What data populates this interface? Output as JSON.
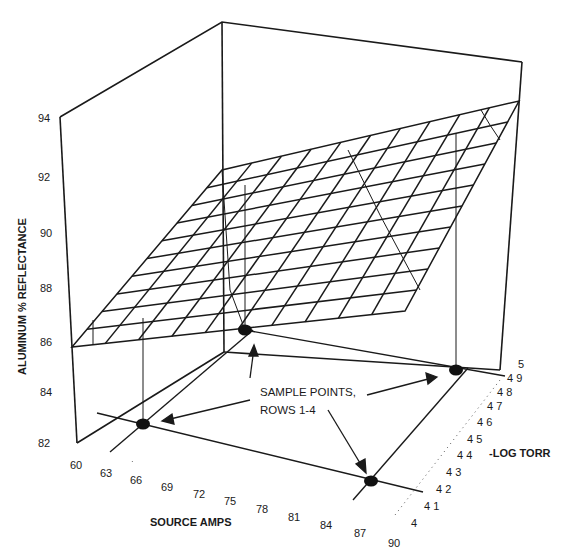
{
  "chart_data": {
    "type": "surface3d",
    "title": "",
    "zlabel": "ALUMINUM % REFLECTANCE",
    "xlabel": "SOURCE AMPS",
    "ylabel": "-LOG TORR",
    "z_ticks": [
      "82",
      "84",
      "86",
      "88",
      "90",
      "92",
      "94"
    ],
    "z_range": [
      82,
      94
    ],
    "x_ticks": [
      "60",
      "63",
      "66",
      "69",
      "72",
      "75",
      "78",
      "81",
      "84",
      "87",
      "90"
    ],
    "x_range": [
      60,
      90
    ],
    "y_ticks": [
      "4",
      "4 1",
      "4 2",
      "4 3",
      "4 4",
      "4 5",
      "4 6",
      "4 7",
      "4 8",
      "4 9",
      "5"
    ],
    "y_values": [
      4.0,
      4.1,
      4.2,
      4.3,
      4.4,
      4.5,
      4.6,
      4.7,
      4.8,
      4.9,
      5.0
    ],
    "y_range": [
      4.0,
      5.0
    ],
    "surface": {
      "description": "Planar response surface rising from ~86% at (60 A, -log torr 4) to ~93% at (90 A, -log torr 5)",
      "corners": [
        {
          "amps": 60,
          "neg_log_torr": 4.0,
          "reflectance": 86.0
        },
        {
          "amps": 60,
          "neg_log_torr": 5.0,
          "reflectance": 90.3
        },
        {
          "amps": 90,
          "neg_log_torr": 5.0,
          "reflectance": 93.4
        },
        {
          "amps": 90,
          "neg_log_torr": 4.0,
          "reflectance": 89.0
        }
      ],
      "grid_divisions": 10
    },
    "sample_points": [
      {
        "amps": 63,
        "neg_log_torr": 4.9
      },
      {
        "amps": 63,
        "neg_log_torr": 4.3
      },
      {
        "amps": 87,
        "neg_log_torr": 4.9
      },
      {
        "amps": 87,
        "neg_log_torr": 4.2
      }
    ],
    "annotations": [
      {
        "text": "SAMPLE POINTS,",
        "line": 1
      },
      {
        "text": "ROWS 1-4",
        "line": 2
      }
    ],
    "grid": false,
    "legend": "none"
  },
  "labels": {
    "zlabel": "ALUMINUM % REFLECTANCE",
    "xlabel": "SOURCE AMPS",
    "ylabel": "-LOG TORR",
    "annotation_line1": "SAMPLE POINTS,",
    "annotation_line2": "ROWS 1-4",
    "z_ticks": [
      "82",
      "84",
      "86",
      "88",
      "90",
      "92",
      "94"
    ],
    "x_ticks": [
      "60",
      "63",
      "66",
      "69",
      "72",
      "75",
      "78",
      "81",
      "84",
      "87",
      "90"
    ],
    "y_ticks": [
      "4",
      "4 1",
      "4 2",
      "4 3",
      "4 4",
      "4 5",
      "4 6",
      "4 7",
      "4 8",
      "4 9",
      "5"
    ]
  }
}
